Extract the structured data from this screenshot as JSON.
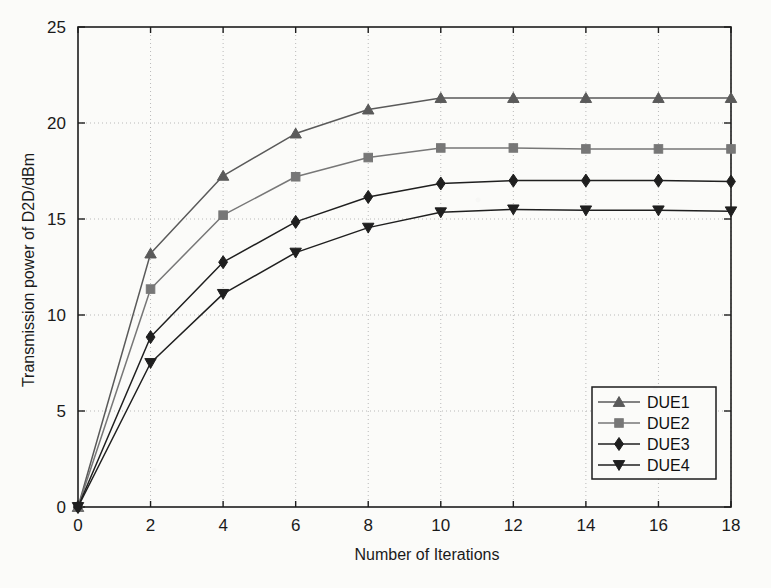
{
  "chart_data": {
    "type": "line",
    "title": "",
    "xlabel": "Number of Iterations",
    "ylabel": "Transmission power of D2D/dBm",
    "xlim": [
      0,
      18
    ],
    "ylim": [
      0,
      25
    ],
    "xticks": [
      0,
      2,
      4,
      6,
      8,
      10,
      12,
      14,
      16,
      18
    ],
    "yticks": [
      0,
      5,
      10,
      15,
      20,
      25
    ],
    "xtick_labels": [
      "0",
      "2",
      "4",
      "6",
      "8",
      "10",
      "12",
      "14",
      "16",
      "18"
    ],
    "ytick_labels": [
      "0",
      "5",
      "10",
      "15",
      "20",
      "25"
    ],
    "grid": true,
    "grid_style": "dotted",
    "legend_position": "lower right",
    "x": [
      0,
      2,
      4,
      6,
      8,
      10,
      12,
      14,
      16,
      18
    ],
    "series": [
      {
        "name": "DUE1",
        "marker": "triangle-up",
        "color": "#5a5a5a",
        "values": [
          0,
          13.2,
          17.25,
          19.45,
          20.7,
          21.3,
          21.3,
          21.3,
          21.3,
          21.3
        ]
      },
      {
        "name": "DUE2",
        "marker": "square",
        "color": "#777777",
        "values": [
          0,
          11.35,
          15.2,
          17.2,
          18.2,
          18.7,
          18.7,
          18.65,
          18.65,
          18.65
        ]
      },
      {
        "name": "DUE3",
        "marker": "diamond",
        "color": "#1f1f1f",
        "values": [
          0,
          8.85,
          12.75,
          14.85,
          16.15,
          16.85,
          17.0,
          17.0,
          17.0,
          16.95
        ]
      },
      {
        "name": "DUE4",
        "marker": "triangle-down",
        "color": "#1f1f1f",
        "values": [
          0,
          7.5,
          11.1,
          13.25,
          14.55,
          15.35,
          15.5,
          15.45,
          15.45,
          15.4
        ]
      }
    ]
  },
  "legend": {
    "entries": [
      "DUE1",
      "DUE2",
      "DUE3",
      "DUE4"
    ]
  },
  "axes": {
    "x_title": "Number of Iterations",
    "y_title": "Transmission power of D2D/dBm"
  },
  "colors": {
    "axis": "#1d1d1d",
    "grid": "#b9b9b9",
    "background": "#fbfbf9"
  }
}
